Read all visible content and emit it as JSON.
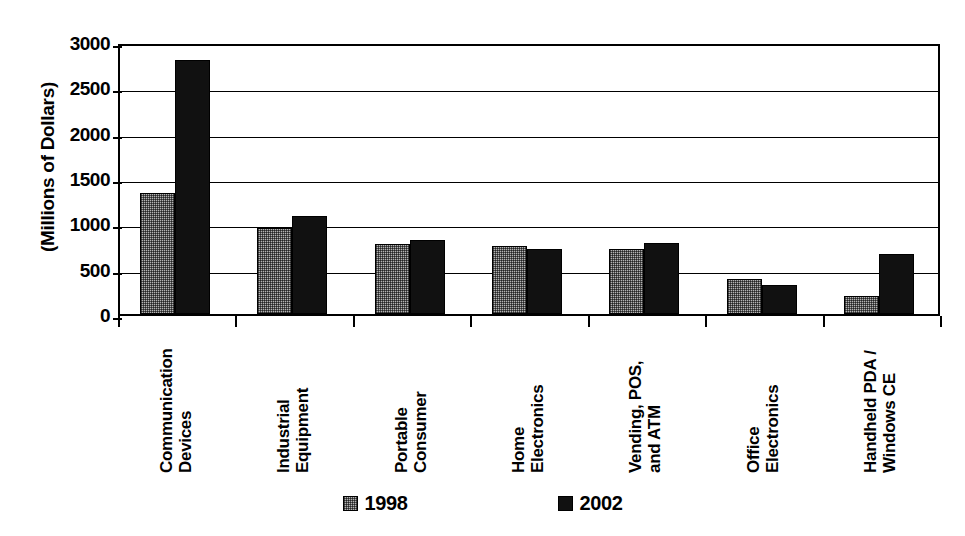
{
  "chart_data": {
    "type": "bar",
    "title": "",
    "subtitle": "",
    "xlabel": "",
    "ylabel": "(Millions of Dollars)",
    "ylim": [
      0,
      3000
    ],
    "ytick_values": [
      3000,
      2500,
      2000,
      1500,
      1000,
      500,
      0
    ],
    "ytick_labels": [
      "3000",
      "2500",
      "2000",
      "1500",
      "1000",
      "500",
      "0"
    ],
    "grid": true,
    "grid_axis": "y",
    "legend_position": "bottom",
    "categories": [
      "Communication\nDevices",
      "Industrial\nEquipment",
      "Portable\nConsumer",
      "Home\nElectronics",
      "Vending, POS,\nand ATM",
      "Office\nElectronics",
      "Handheld PDA /\nWindows CE"
    ],
    "series": [
      {
        "name": "1998",
        "color": "#b4b4b4",
        "values": [
          1330,
          950,
          770,
          745,
          720,
          390,
          200
        ]
      },
      {
        "name": "2002",
        "color": "#111111",
        "values": [
          2800,
          1080,
          820,
          720,
          780,
          320,
          660
        ]
      }
    ]
  },
  "legend": {
    "items": [
      {
        "label": "1998",
        "swatch": "gray-stipple-swatch"
      },
      {
        "label": "2002",
        "swatch": "black-swatch"
      }
    ]
  }
}
